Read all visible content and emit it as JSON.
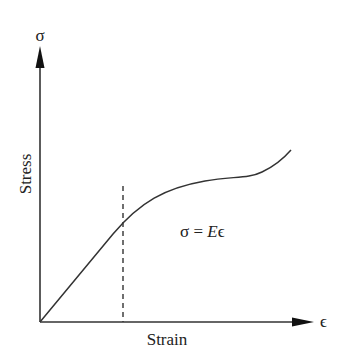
{
  "diagram": {
    "type": "stress-strain curve",
    "y_axis": {
      "symbol": "σ",
      "label": "Stress"
    },
    "x_axis": {
      "symbol": "ϵ",
      "label": "Strain"
    },
    "equation": {
      "lhs": "σ = ",
      "E": "E",
      "eps": "ϵ"
    },
    "curve": {
      "description": "Linear elastic region from origin, followed by a plateau and strain-hardening rise",
      "color": "#333333"
    },
    "dashed_line": {
      "description": "Vertical dashed line marking the end of the linear (elastic) region",
      "color": "#333333"
    }
  }
}
